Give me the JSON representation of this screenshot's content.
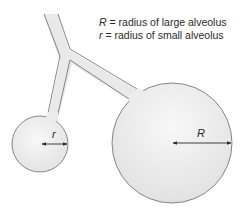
{
  "diagram": {
    "legend": [
      {
        "symbol": "R",
        "text": " = radius of large alveolus"
      },
      {
        "symbol": "r",
        "text": " = radius of small alveolus"
      }
    ],
    "labels": {
      "small_radius": "r",
      "large_radius": "R"
    },
    "colors": {
      "fill": "#e9e9e9",
      "fill_highlight": "#f7f7f7",
      "stroke": "#6a6a6a",
      "arrow": "#2a2a2a",
      "text": "#2a2a2a"
    },
    "shapes": {
      "small_alveolus": {
        "cx": 40,
        "cy": 144,
        "r": 28
      },
      "large_alveolus": {
        "cx": 172,
        "cy": 143,
        "r": 60
      }
    }
  }
}
